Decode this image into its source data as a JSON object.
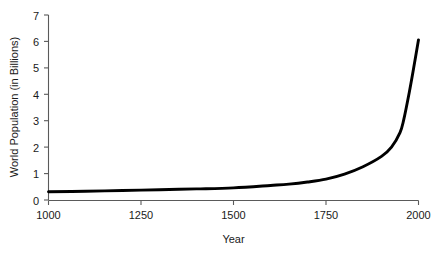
{
  "chart_data": {
    "type": "line",
    "title": "",
    "xlabel": "Year",
    "ylabel": "World Population (in Billions)",
    "xlim": [
      1000,
      2000
    ],
    "ylim": [
      0,
      7
    ],
    "grid": false,
    "legend": "none",
    "x_ticks": [
      1000,
      1250,
      1500,
      1750,
      2000
    ],
    "x_tick_labels": [
      "1000",
      "1250",
      "1500",
      "1750",
      "2000"
    ],
    "y_ticks": [
      0,
      1,
      2,
      3,
      4,
      5,
      6,
      7
    ],
    "y_tick_labels": [
      "0",
      "1",
      "2",
      "3",
      "4",
      "5",
      "6",
      "7"
    ],
    "series": [
      {
        "name": "World Population",
        "color": "#000000",
        "x": [
          1000,
          1100,
          1200,
          1300,
          1400,
          1500,
          1600,
          1650,
          1700,
          1750,
          1800,
          1850,
          1900,
          1927,
          1950,
          1960,
          1975,
          1987,
          2000
        ],
        "values": [
          0.31,
          0.33,
          0.36,
          0.39,
          0.42,
          0.46,
          0.55,
          0.6,
          0.68,
          0.79,
          0.98,
          1.26,
          1.65,
          2.0,
          2.55,
          3.03,
          4.07,
          5.0,
          6.06
        ]
      }
    ]
  },
  "axes": {
    "x_axis_name": "x-axis",
    "y_axis_name": "y-axis"
  }
}
